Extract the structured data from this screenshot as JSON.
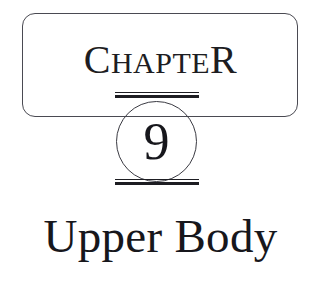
{
  "page": {
    "background_color": "#ffffff",
    "ink_color": "#1d1d22",
    "width": 321,
    "height": 291
  },
  "chapter_header": {
    "label_leading_cap": "C",
    "label_small_caps": "HAPTE",
    "label_trailing_cap": "R",
    "label_full": "CHAPTER",
    "frame_border_color": "#4a4a52"
  },
  "chapter_number": {
    "value": "9",
    "circle_border_color": "#3a3a42"
  },
  "rules": {
    "top_rule_name": "double-rule",
    "bottom_rule_name": "double-rule"
  },
  "chapter_title": {
    "text": "Upper Body"
  }
}
